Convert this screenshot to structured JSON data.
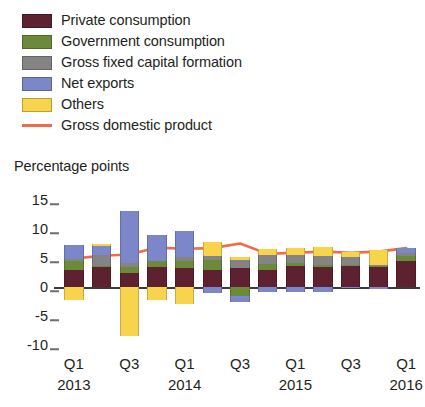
{
  "legend": {
    "items": [
      {
        "label": "Private consumption",
        "color": "#5e2130",
        "marker": "swatch"
      },
      {
        "label": "Government consumption",
        "color": "#6b8a3a",
        "marker": "swatch"
      },
      {
        "label": "Gross fixed capital formation",
        "color": "#848484",
        "marker": "swatch"
      },
      {
        "label": "Net exports",
        "color": "#7b87c8",
        "marker": "swatch"
      },
      {
        "label": "Others",
        "color": "#f7d44c",
        "marker": "swatch"
      },
      {
        "label": "Gross domestic product",
        "color": "#ef6b4a",
        "marker": "line"
      }
    ]
  },
  "axis_title": "Percentage points",
  "chart_data": {
    "type": "bar",
    "stacked": true,
    "title": "",
    "subtitle": "",
    "xlabel": "",
    "ylabel": "Percentage points",
    "ylim": [
      -10,
      15
    ],
    "yticks": [
      15,
      10,
      5,
      0,
      -5,
      -10
    ],
    "grid": false,
    "legend_position": "top-left",
    "x": [
      "Q1 2013",
      "Q2 2013",
      "Q3 2013",
      "Q4 2013",
      "Q1 2014",
      "Q2 2014",
      "Q3 2014",
      "Q4 2014",
      "Q1 2015",
      "Q2 2015",
      "Q3 2015",
      "Q4 2015",
      "Q1 2016"
    ],
    "xtick_labels": [
      {
        "index": 0,
        "quarter": "Q1",
        "year": "2013"
      },
      {
        "index": 2,
        "quarter": "Q3",
        "year": ""
      },
      {
        "index": 4,
        "quarter": "Q1",
        "year": "2014"
      },
      {
        "index": 6,
        "quarter": "Q3",
        "year": ""
      },
      {
        "index": 8,
        "quarter": "Q1",
        "year": "2015"
      },
      {
        "index": 10,
        "quarter": "Q3",
        "year": ""
      },
      {
        "index": 12,
        "quarter": "Q1",
        "year": "2016"
      }
    ],
    "series": [
      {
        "name": "Private consumption",
        "color": "#5e2130",
        "values": [
          3.0,
          3.4,
          2.4,
          3.5,
          3.2,
          3.0,
          3.3,
          3.0,
          3.7,
          3.5,
          3.6,
          3.4,
          4.4
        ]
      },
      {
        "name": "Government consumption",
        "color": "#6b8a3a",
        "values": [
          1.5,
          0.3,
          1.0,
          0.9,
          1.3,
          1.6,
          -1.5,
          1.0,
          0.4,
          0.3,
          0.2,
          0.2,
          1.0
        ]
      },
      {
        "name": "Gross fixed capital formation",
        "color": "#848484",
        "values": [
          0.4,
          1.9,
          0.7,
          0.0,
          0.6,
          0.8,
          1.3,
          1.6,
          1.5,
          1.6,
          1.3,
          0.2,
          0.4
        ]
      },
      {
        "name": "Net exports",
        "color": "#7b87c8",
        "values": [
          2.3,
          1.4,
          9.0,
          4.6,
          4.5,
          -1.0,
          -1.1,
          -0.9,
          -0.9,
          -0.8,
          -0.2,
          -0.3,
          0.9
        ]
      },
      {
        "name": "Others",
        "color": "#f7d44c",
        "values": [
          -2.3,
          0.4,
          -8.5,
          -2.2,
          -3.0,
          2.3,
          0.6,
          1.0,
          1.2,
          1.5,
          1.0,
          2.6,
          0.0
        ]
      }
    ],
    "gdp_line": {
      "name": "Gross domestic product",
      "color": "#ef6b4a",
      "values": [
        4.9,
        5.4,
        5.6,
        6.8,
        6.6,
        6.7,
        7.5,
        5.7,
        5.9,
        6.1,
        5.9,
        6.1,
        6.7
      ]
    }
  }
}
